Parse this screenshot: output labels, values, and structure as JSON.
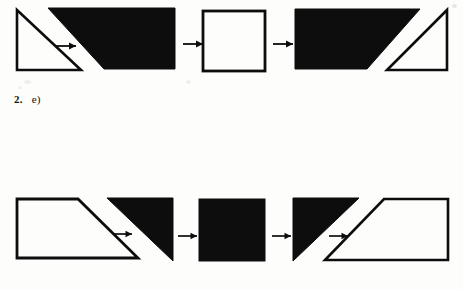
{
  "page": {
    "background_color": "#fdfdfc",
    "ink_color": "#0d0d0d",
    "width": 463,
    "height": 290
  },
  "label": {
    "number": "2.",
    "option": "e)"
  },
  "rows": [
    {
      "name": "top-sequence",
      "steps": [
        {
          "index": 1,
          "shape": "right-triangle",
          "fill": "white",
          "stroke": "black",
          "description": "right triangle, right angle at bottom-left"
        },
        {
          "index": 2,
          "shape": "trapezoid",
          "fill": "black",
          "stroke": "black",
          "description": "solid black trapezoid, diagonal cut at bottom-left"
        },
        {
          "index": 3,
          "shape": "square",
          "fill": "white",
          "stroke": "black",
          "description": "white square outline"
        },
        {
          "index": 4,
          "shape": "trapezoid-plus-triangle",
          "fill": "black",
          "stroke": "black",
          "description": "solid black trapezoid with white outlined right triangle at right"
        }
      ],
      "arrows": [
        "arrow-1",
        "arrow-2",
        "arrow-3"
      ]
    },
    {
      "name": "bottom-sequence",
      "steps": [
        {
          "index": 1,
          "shape": "trapezoid",
          "fill": "white",
          "stroke": "black",
          "description": "white trapezoid outline, slanted right edge"
        },
        {
          "index": 2,
          "shape": "right-triangle",
          "fill": "black",
          "stroke": "black",
          "description": "solid black right triangle, right angle at top-right"
        },
        {
          "index": 3,
          "shape": "square",
          "fill": "black",
          "stroke": "black",
          "description": "solid black square"
        },
        {
          "index": 4,
          "shape": "triangle-plus-trapezoid",
          "fill": "mixed",
          "stroke": "black",
          "description": "solid black right triangle with white outlined trapezoid at right"
        }
      ],
      "arrows": [
        "arrow-4",
        "arrow-5",
        "arrow-6"
      ]
    }
  ]
}
